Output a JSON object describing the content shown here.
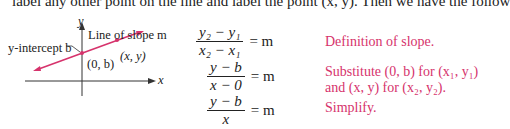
{
  "top_text": "label any other point on the line and label the point (x, y). Then we have the follow",
  "graph": {
    "y_axis_label": "y",
    "x_axis_label": "x",
    "line_label": "Line of slope m",
    "intercept_label": "y-intercept b",
    "point_intercept": "(0, b)",
    "point_general": "(x, y)",
    "line_color": "#d6336c"
  },
  "equations": [
    {
      "numerator": "y₂ − y₁",
      "denominator": "x₂ − x₁",
      "rhs": "= m",
      "note": "Definition of slope."
    },
    {
      "numerator": "y − b",
      "denominator": "x − 0",
      "rhs": "= m",
      "note_line1": "Substitute (0, b) for (x₁, y₁)",
      "note_line2": "and (x, y) for (x₂, y₂)."
    },
    {
      "numerator": "y − b",
      "denominator": "x",
      "rhs": "= m",
      "note": "Simplify."
    }
  ],
  "colors": {
    "accent": "#d6336c",
    "text": "#222222"
  }
}
